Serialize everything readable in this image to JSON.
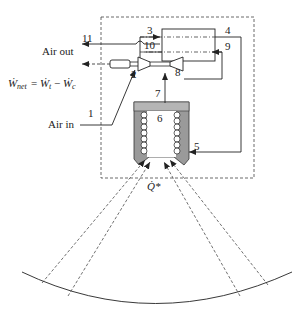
{
  "diagram": {
    "labels": {
      "air_out": "Air out",
      "air_in": "Air in",
      "w_net": "Ẇ",
      "w_net_sub": "net",
      "eq": "=",
      "w_t": "Ẇ",
      "w_t_sub": "t",
      "minus": "−",
      "w_c": "Ẇ",
      "w_c_sub": "c",
      "q_star": "Q̇*"
    },
    "state_points": {
      "p1": "1",
      "p2": "2",
      "p3": "3",
      "p4": "4",
      "p5": "5",
      "p6": "6",
      "p7": "7",
      "p8": "8",
      "p9": "9",
      "p10": "10",
      "p11": "11"
    },
    "components": [
      "compressor",
      "turbine",
      "generator",
      "recuperator",
      "solar receiver",
      "heliostat field"
    ],
    "colors": {
      "line": "#222222",
      "receiver_fill": "#9a9a9a",
      "receiver_top": "#b5b5b5",
      "background": "#ffffff"
    }
  }
}
